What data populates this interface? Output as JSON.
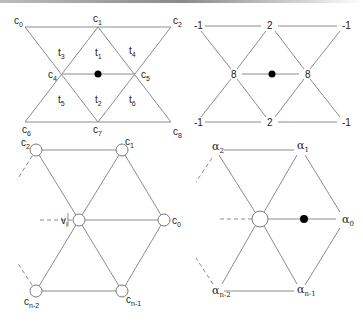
{
  "diagram": {
    "colors": {
      "edge": "#8c8c8c",
      "node_stroke": "#7a7a7a",
      "dot": "#000000",
      "text": "#222222"
    },
    "panel_top_left": {
      "vertex_labels": [
        {
          "id": "c0",
          "base": "c",
          "sub": "0",
          "x": 14,
          "y": 24
        },
        {
          "id": "c1",
          "base": "c",
          "sub": "1",
          "x": 93,
          "y": 22
        },
        {
          "id": "c2",
          "base": "c",
          "sub": "2",
          "x": 173,
          "y": 24
        },
        {
          "id": "c4",
          "base": "c",
          "sub": "4",
          "x": 48,
          "y": 78
        },
        {
          "id": "c5",
          "base": "c",
          "sub": "5",
          "x": 141,
          "y": 78
        },
        {
          "id": "c6",
          "base": "c",
          "sub": "6",
          "x": 22,
          "y": 133
        },
        {
          "id": "c7",
          "base": "c",
          "sub": "7",
          "x": 93,
          "y": 133
        },
        {
          "id": "c8",
          "base": "c",
          "sub": "8",
          "x": 173,
          "y": 135
        }
      ],
      "triangle_labels": [
        {
          "id": "t1",
          "base": "t",
          "sub": "1",
          "x": 95,
          "y": 56
        },
        {
          "id": "t2",
          "base": "t",
          "sub": "2",
          "x": 95,
          "y": 103
        },
        {
          "id": "t3",
          "base": "t",
          "sub": "3",
          "x": 58,
          "y": 56
        },
        {
          "id": "t4",
          "base": "t",
          "sub": "4",
          "x": 129,
          "y": 54
        },
        {
          "id": "t5",
          "base": "t",
          "sub": "5",
          "x": 58,
          "y": 103
        },
        {
          "id": "t6",
          "base": "t",
          "sub": "6",
          "x": 129,
          "y": 103
        }
      ]
    },
    "panel_top_right": {
      "weights": [
        {
          "value": "-1",
          "x": 194,
          "y": 29
        },
        {
          "value": "2",
          "x": 267,
          "y": 29
        },
        {
          "value": "-1",
          "x": 342,
          "y": 29
        },
        {
          "value": "8",
          "x": 231,
          "y": 78
        },
        {
          "value": "8",
          "x": 305,
          "y": 78
        },
        {
          "value": "-1",
          "x": 194,
          "y": 126
        },
        {
          "value": "2",
          "x": 267,
          "y": 126
        },
        {
          "value": "-1",
          "x": 342,
          "y": 126
        }
      ]
    },
    "panel_bottom_left": {
      "vertex_labels": [
        {
          "id": "c2",
          "base": "c",
          "sub": "2",
          "x": 21,
          "y": 146
        },
        {
          "id": "c1",
          "base": "c",
          "sub": "1",
          "x": 125,
          "y": 145
        },
        {
          "id": "vi",
          "base": "v",
          "sub": "i",
          "x": 61,
          "y": 224
        },
        {
          "id": "c0",
          "base": "c",
          "sub": "0",
          "x": 172,
          "y": 224
        },
        {
          "id": "cn2",
          "base": "c",
          "sub": "n-2",
          "x": 24,
          "y": 305
        },
        {
          "id": "cn1",
          "base": "c",
          "sub": "n-1",
          "x": 126,
          "y": 303
        }
      ]
    },
    "panel_bottom_right": {
      "vertex_labels": [
        {
          "id": "a2",
          "base": "α",
          "sub": "2",
          "x": 212,
          "y": 150
        },
        {
          "id": "a1",
          "base": "α",
          "sub": "1",
          "x": 297,
          "y": 149
        },
        {
          "id": "a0",
          "base": "α",
          "sub": "0",
          "x": 342,
          "y": 223
        },
        {
          "id": "an2",
          "base": "α",
          "sub": "n-2",
          "x": 212,
          "y": 294
        },
        {
          "id": "an1",
          "base": "α",
          "sub": "n-1",
          "x": 297,
          "y": 293
        }
      ]
    }
  }
}
